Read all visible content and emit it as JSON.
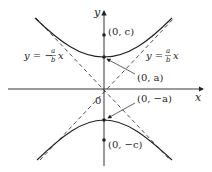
{
  "figure": {
    "type": "hyperbola-vertical",
    "colors": {
      "stroke": "#231f20",
      "background": "#ffffff"
    },
    "axes": {
      "x_label": "x",
      "y_label": "y",
      "origin_label": "0"
    },
    "points": {
      "focus_top": "(0, c)",
      "vertex_top": "(0, a)",
      "vertex_bottom": "(0, −a)",
      "focus_bottom": "(0, −c)"
    },
    "asymptotes": {
      "left": {
        "prefix": "y = −",
        "num": "a",
        "den": "b",
        "var": "x"
      },
      "right": {
        "prefix": "y = ",
        "num": "a",
        "den": "b",
        "var": "x"
      }
    }
  }
}
